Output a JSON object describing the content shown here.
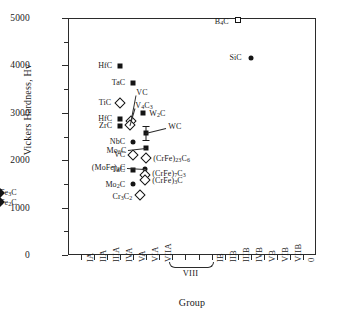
{
  "chart_data": {
    "type": "scatter",
    "title": "",
    "xlabel": "Group",
    "ylabel": "Vickers Hardness, Hv",
    "ylim": [
      0,
      5000
    ],
    "yticks": [
      0,
      1000,
      2000,
      3000,
      4000,
      5000
    ],
    "ytick_labels": [
      "0",
      "1000",
      "2000",
      "3000",
      "4000",
      "5000"
    ],
    "grid": false,
    "legend": "none",
    "categories": [
      "IA",
      "IIA",
      "IIIA",
      "IVA",
      "VA",
      "VIA",
      "VIIA",
      "VIII",
      "VIII",
      "VIII",
      "IB",
      "IIB",
      "IIIB",
      "IVB",
      "VB",
      "VIB",
      "VIIB",
      "0"
    ],
    "xtick_labels": [
      "IA",
      "IIA",
      "IIIA",
      "IVA",
      "VA",
      "VIA",
      "VIIA",
      "IB",
      "IIB",
      "IIIB",
      "IVB",
      "VB",
      "VIB",
      "VIIB",
      "0"
    ],
    "group_bracket": {
      "label": "VIII",
      "spans": [
        "VIII-1",
        "VIII-2",
        "VIII-3"
      ]
    },
    "points": [
      {
        "label": "B4C",
        "text": "B",
        "sub": "4",
        "tail": "C",
        "group": "IIIB",
        "value": 4950,
        "marker": "open-square",
        "label_side": "left"
      },
      {
        "label": "SiC",
        "text": "SiC",
        "sub": "",
        "tail": "",
        "group": "IVB",
        "value": 4150,
        "marker": "filled-circle",
        "label_side": "left"
      },
      {
        "label": "HfC-a",
        "text": "HfC",
        "sub": "",
        "tail": "",
        "group": "IVA",
        "value": 3980,
        "marker": "filled-square",
        "label_side": "left"
      },
      {
        "label": "TaC-a",
        "text": "TaC",
        "sub": "",
        "tail": "",
        "group": "VA",
        "value": 3620,
        "marker": "filled-square",
        "label_side": "left"
      },
      {
        "label": "TiC",
        "text": "TiC",
        "sub": "",
        "tail": "",
        "group": "IVA",
        "value": 3200,
        "marker": "open-diamond",
        "label_side": "left"
      },
      {
        "label": "VC",
        "text": "VC",
        "sub": "",
        "tail": "",
        "group": "VA",
        "value": 2830,
        "marker": "open-diamond",
        "label_side": "leader-up"
      },
      {
        "label": "V4C3",
        "text": "V",
        "sub": "4",
        "tail": "C3",
        "group": "VA",
        "value": 2750,
        "marker": "open-diamond",
        "label_side": "leader-up"
      },
      {
        "label": "HfC-b",
        "text": "HfC",
        "sub": "",
        "tail": "",
        "group": "IVA",
        "value": 2860,
        "marker": "filled-square",
        "label_side": "left"
      },
      {
        "label": "ZrC",
        "text": "ZrC",
        "sub": "",
        "tail": "",
        "group": "IVA",
        "value": 2720,
        "marker": "filled-square",
        "label_side": "left"
      },
      {
        "label": "W2C",
        "text": "W",
        "sub": "2",
        "tail": "C",
        "group": "VIA",
        "value": 3000,
        "marker": "filled-square",
        "label_side": "right"
      },
      {
        "label": "WC",
        "text": "WC",
        "sub": "",
        "tail": "",
        "group": "VIA",
        "value": 2570,
        "marker": "filled-square",
        "label_side": "leader-right",
        "err_low": 2430,
        "err_high": 2720
      },
      {
        "label": "NbC",
        "text": "NbC",
        "sub": "",
        "tail": "",
        "group": "VA",
        "value": 2380,
        "marker": "filled-circle",
        "label_side": "left"
      },
      {
        "label": "Mo2C-a",
        "text": "Mo",
        "sub": "2",
        "tail": "C",
        "group": "VIA",
        "value": 2250,
        "marker": "filled-square",
        "label_side": "leader-left"
      },
      {
        "label": "VC-b",
        "text": "VC",
        "sub": "",
        "tail": "",
        "group": "VA",
        "value": 2100,
        "marker": "open-diamond",
        "label_side": "left"
      },
      {
        "label": "(CrFe)23C6",
        "text": "(CrFe)",
        "sub": "23",
        "tail": "C6",
        "group": "VIA",
        "value": 2050,
        "marker": "open-diamond",
        "label_side": "right"
      },
      {
        "label": "TaC-b",
        "text": "TaC",
        "sub": "",
        "tail": "",
        "group": "VA",
        "value": 1800,
        "marker": "filled-square",
        "label_side": "left"
      },
      {
        "label": "(MoFe)2C",
        "text": "(MoFe)",
        "sub": "2",
        "tail": "C",
        "group": "VIA",
        "value": 1820,
        "marker": "filled-circle",
        "label_side": "leader-left"
      },
      {
        "label": "(CrFe)7C3",
        "text": "(CrFe)",
        "sub": "7",
        "tail": "C3",
        "group": "VIA",
        "value": 1680,
        "marker": "open-diamond",
        "label_side": "right"
      },
      {
        "label": "(CrFe)3C",
        "text": "(CrFe)",
        "sub": "3",
        "tail": "C",
        "group": "VIA",
        "value": 1580,
        "marker": "open-diamond",
        "label_side": "right"
      },
      {
        "label": "Mo2C-b",
        "text": "Mo",
        "sub": "2",
        "tail": "C",
        "group": "VA",
        "value": 1500,
        "marker": "filled-circle",
        "label_side": "left"
      },
      {
        "label": "Cr3C2",
        "text": "Cr",
        "sub": "3",
        "tail": "C2",
        "group": "VIA",
        "value": 1270,
        "marker": "open-diamond",
        "label_side": "left"
      },
      {
        "label": "Fe3C",
        "text": "Fe",
        "sub": "3",
        "tail": "C",
        "group": "VIII-1",
        "value": 1300,
        "marker": "filled-diamond",
        "label_side": "right"
      },
      {
        "label": "Fe2C",
        "text": "Fe",
        "sub": "2",
        "tail": "C",
        "group": "VIII-1",
        "value": 1120,
        "marker": "filled-diamond",
        "label_side": "right"
      }
    ]
  }
}
